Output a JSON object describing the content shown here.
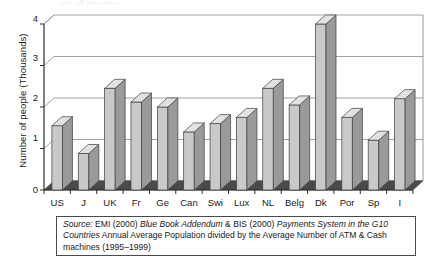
{
  "chart_data": {
    "type": "bar",
    "title": "",
    "subtitle": "",
    "xlabel": "",
    "ylabel": "Number of people (Thousands)",
    "ylim": [
      0,
      4
    ],
    "yticks": [
      0,
      1,
      2,
      3,
      4
    ],
    "ytick_labels": [
      "0",
      "1",
      "2",
      "3",
      "4"
    ],
    "grid": true,
    "legend": false,
    "legend_position": "none",
    "style": "3d-column",
    "categories": [
      "US",
      "J",
      "UK",
      "Fr",
      "Ge",
      "Can",
      "Swi",
      "Lux",
      "NL",
      "Belg",
      "Dk",
      "Por",
      "Sp",
      "I"
    ],
    "values": [
      1.55,
      0.88,
      2.45,
      2.12,
      2.0,
      1.4,
      1.6,
      1.75,
      2.45,
      2.05,
      4.0,
      1.75,
      1.2,
      2.2
    ],
    "annotations": []
  },
  "axis": {
    "y_title": "Number of people (Thousands)",
    "y_ticks": [
      "4",
      "3",
      "2",
      "1",
      "0"
    ],
    "x_ticks": [
      "US",
      "J",
      "UK",
      "Fr",
      "Ge",
      "Can",
      "Swi",
      "Lux",
      "NL",
      "Belg",
      "Dk",
      "Por",
      "Sp",
      "I"
    ]
  },
  "caption": {
    "source_label": "Source:",
    "line_rest_1a": " EMI (2000) ",
    "italic_1": "Blue Book Addendum",
    "line_rest_1b": " & BIS (2000) ",
    "italic_2": "Payments System in the G10 Countries",
    "line_rest_2": " Annual Average Population divided by the Average Number of ATM & Cash machines (1995–1999)",
    "full_text": "Source: EMI (2000) Blue Book Addendum & BIS (2000) Payments System in the G10 Countries Annual Average Population divided by the Average Number of ATM & Cash machines (1995–1999)"
  },
  "colors": {
    "bar_face": "#c9c9c9",
    "bar_side": "#9a9a9a",
    "bar_top": "#e2e2e2",
    "bar_outline": "#3d3d3d",
    "floor": "#4a4a4a",
    "gridline": "#8c8c8c",
    "axis": "#2b2b2b",
    "text": "#1a1a1a",
    "background": "#ffffff"
  },
  "top_sliver": {
    "text": "cut off heading"
  }
}
